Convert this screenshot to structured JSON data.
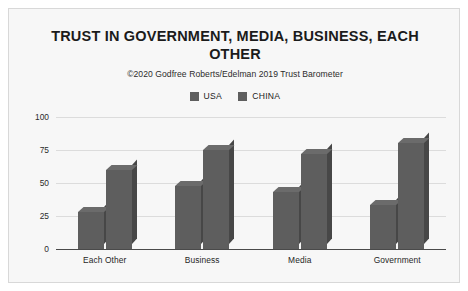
{
  "chart_data": {
    "type": "bar",
    "title": "TRUST IN GOVERNMENT, MEDIA, BUSINESS, EACH OTHER",
    "subtitle": "©2020 Godfree Roberts/Edelman 2019 Trust Barometer",
    "categories": [
      "Each Other",
      "Business",
      "Media",
      "Government"
    ],
    "series": [
      {
        "name": "USA",
        "values": [
          28,
          48,
          43,
          33
        ],
        "color": "#5e5e5e"
      },
      {
        "name": "CHINA",
        "values": [
          60,
          75,
          72,
          80
        ],
        "color": "#5e5e5e"
      }
    ],
    "xlabel": "",
    "ylabel": "",
    "ylim": [
      0,
      100
    ],
    "yticks": [
      0,
      25,
      50,
      75,
      100
    ],
    "ytick_labels": [
      "0",
      "25",
      "50",
      "75",
      "100"
    ],
    "grid": true,
    "legend_position": "top",
    "style": "3d-bar",
    "background_color": "#f7f7f7",
    "gridline_color": "#dcdcdc",
    "axis_color": "#4a4a4a"
  }
}
